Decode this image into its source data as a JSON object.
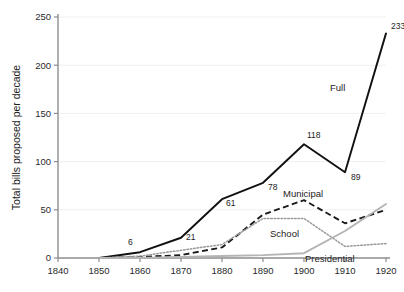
{
  "chart_data": {
    "type": "line",
    "title": "",
    "subtitle": "",
    "xlabel": "",
    "ylabel": "Total bills proposed per decade",
    "xlim": [
      1840,
      1920
    ],
    "ylim": [
      0,
      250
    ],
    "xticks": [
      1840,
      1850,
      1860,
      1870,
      1880,
      1890,
      1900,
      1910,
      1920
    ],
    "yticks": [
      0,
      50,
      100,
      150,
      200,
      250
    ],
    "grid": "horizontal",
    "legend_position": "inline-annotations",
    "x": [
      1850,
      1860,
      1870,
      1880,
      1890,
      1900,
      1910,
      1920
    ],
    "series": [
      {
        "name": "Full",
        "style": "solid",
        "color": "#111111",
        "values": [
          0,
          6,
          21,
          61,
          78,
          118,
          89,
          233
        ]
      },
      {
        "name": "Municipal",
        "style": "dashed",
        "color": "#1a1a1a",
        "values": [
          0,
          1,
          3,
          11,
          45,
          60,
          36,
          50
        ]
      },
      {
        "name": "School",
        "style": "dotted",
        "color": "#9a9a9a",
        "values": [
          0,
          2,
          8,
          14,
          41,
          41,
          12,
          15
        ]
      },
      {
        "name": "Presidential",
        "style": "solid-light",
        "color": "#b4b4b4",
        "values": [
          0,
          0,
          1,
          2,
          3,
          5,
          28,
          56
        ]
      }
    ],
    "point_labels": [
      {
        "series": "Full",
        "x": 1860,
        "value": 6,
        "text": "6"
      },
      {
        "series": "Full",
        "x": 1870,
        "value": 21,
        "text": "21"
      },
      {
        "series": "Full",
        "x": 1880,
        "value": 61,
        "text": "61"
      },
      {
        "series": "Full",
        "x": 1890,
        "value": 78,
        "text": "78"
      },
      {
        "series": "Full",
        "x": 1900,
        "value": 118,
        "text": "118"
      },
      {
        "series": "Full",
        "x": 1910,
        "value": 89,
        "text": "89"
      },
      {
        "series": "Full",
        "x": 1920,
        "value": 233,
        "text": "233"
      }
    ],
    "annotations": [
      {
        "text": "Full",
        "for": "Full"
      },
      {
        "text": "Municipal",
        "for": "Municipal"
      },
      {
        "text": "School",
        "for": "School"
      },
      {
        "text": "Presidential",
        "for": "Presidential"
      }
    ]
  },
  "axis": {
    "y_title": "Total bills proposed per decade",
    "y_tick_labels": [
      "0",
      "50",
      "100",
      "150",
      "200",
      "250"
    ],
    "x_tick_labels": [
      "1840",
      "1850",
      "1860",
      "1870",
      "1880",
      "1890",
      "1900",
      "1910",
      "1920"
    ]
  },
  "labels": {
    "p6": "6",
    "p21": "21",
    "p61": "61",
    "p78": "78",
    "p118": "118",
    "p89": "89",
    "p233": "233",
    "full": "Full",
    "municipal": "Municipal",
    "school": "School",
    "presidential": "Presidential"
  },
  "colors": {
    "full": "#111111",
    "municipal": "#1a1a1a",
    "school": "#9a9a9a",
    "presidential": "#b4b4b4",
    "axis": "#8d8d8d",
    "grid": "#f0f0f0",
    "background": "#ffffff"
  }
}
